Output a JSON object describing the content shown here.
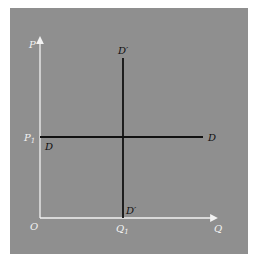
{
  "diagram": {
    "type": "supply-demand-axes",
    "colors": {
      "background": "#8f8f8f",
      "axes": "#f2f2f2",
      "curves": "#111111",
      "axis_labels": "#f2f2f2",
      "curve_labels": "#111111"
    },
    "axes": {
      "y_label": "P",
      "x_label": "Q",
      "origin_label": "O"
    },
    "levels": {
      "price_label": "P",
      "price_subscript": "1",
      "quantity_label": "Q",
      "quantity_subscript": "1"
    },
    "curves": {
      "horizontal_demand": {
        "start_label": "D",
        "end_label": "D"
      },
      "vertical_demand": {
        "top_label": "D′",
        "bottom_label": "D′"
      }
    }
  }
}
